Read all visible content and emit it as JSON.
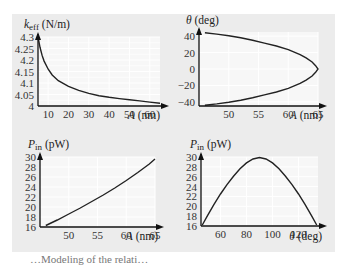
{
  "figure": {
    "panel_color": "#ececec",
    "caption_fragment": "…Modeling of the relati…"
  },
  "chart_data": [
    {
      "id": "keff-vs-A",
      "type": "line",
      "title": "",
      "ylabel": "k_eff (N/m)",
      "ylabel_main": "k",
      "ylabel_sub": "eff",
      "ylabel_unit": "(N/m)",
      "xlabel": "A (nm)",
      "xlabel_var": "A",
      "xlabel_unit": "(nm)",
      "xlim": [
        5,
        65
      ],
      "ylim": [
        4,
        4.3
      ],
      "xticks": [
        10,
        20,
        30,
        40,
        50,
        60
      ],
      "yticks": [
        "4",
        "4.05",
        "4.1",
        "4.15",
        "4.2",
        "4.25",
        "4.3"
      ],
      "grid": true,
      "x": [
        5,
        6,
        7,
        8,
        10,
        12,
        15,
        20,
        25,
        30,
        35,
        40,
        45,
        50,
        55,
        60,
        65
      ],
      "y": [
        4.3,
        4.255,
        4.22,
        4.195,
        4.16,
        4.135,
        4.11,
        4.085,
        4.068,
        4.055,
        4.045,
        4.038,
        4.032,
        4.027,
        4.022,
        4.017,
        4.012
      ]
    },
    {
      "id": "theta-vs-A",
      "type": "line",
      "title": "",
      "ylabel": "θ (deg)",
      "ylabel_main": "θ",
      "ylabel_unit": "(deg)",
      "xlabel": "A (nm)",
      "xlabel_var": "A",
      "xlabel_unit": "(nm)",
      "xlim": [
        45,
        65
      ],
      "ylim": [
        -45,
        45
      ],
      "xticks": [
        50,
        55,
        60,
        65
      ],
      "yticks": [
        "−40",
        "−20",
        "0",
        "20",
        "40"
      ],
      "ytick_values": [
        -40,
        -20,
        0,
        20,
        40
      ],
      "grid": true,
      "x": [
        46,
        48,
        50,
        52,
        54,
        56,
        58,
        60,
        62,
        63,
        64,
        64.6,
        65,
        64.6,
        64,
        63,
        62,
        60,
        58,
        56,
        54,
        52,
        50,
        48,
        46
      ],
      "y": [
        44,
        42.5,
        40.5,
        38,
        35,
        31.5,
        28,
        23.5,
        17.5,
        13.5,
        8.5,
        4,
        0,
        -4,
        -8.5,
        -13.5,
        -17.5,
        -23.5,
        -28,
        -31.5,
        -35,
        -38,
        -40.5,
        -42.5,
        -44
      ]
    },
    {
      "id": "Pin-vs-A",
      "type": "line",
      "title": "",
      "ylabel": "P_in (pW)",
      "ylabel_main": "P",
      "ylabel_sub": "in",
      "ylabel_unit": "(pW)",
      "xlabel": "A (nm)",
      "xlabel_var": "A",
      "xlabel_unit": "(nm)",
      "xlim": [
        45,
        65
      ],
      "ylim": [
        16,
        30
      ],
      "xticks": [
        50,
        55,
        60,
        65
      ],
      "yticks": [
        "16",
        "18",
        "20",
        "22",
        "24",
        "26",
        "28",
        "30"
      ],
      "grid": true,
      "x": [
        46,
        48,
        50,
        52,
        54,
        56,
        58,
        60,
        62,
        64,
        65
      ],
      "y": [
        16.3,
        17.4,
        18.6,
        19.8,
        21.1,
        22.4,
        23.8,
        25.3,
        26.9,
        28.6,
        29.6
      ]
    },
    {
      "id": "Pin-vs-theta",
      "type": "line",
      "title": "",
      "ylabel": "P_in (pW)",
      "ylabel_main": "P",
      "ylabel_sub": "in",
      "ylabel_unit": "(pW)",
      "xlabel": "θ (deg)",
      "xlabel_var": "θ",
      "xlabel_unit": "(deg)",
      "xlim": [
        45,
        135
      ],
      "ylim": [
        16,
        30
      ],
      "xticks": [
        60,
        80,
        100,
        120
      ],
      "yticks": [
        "16",
        "18",
        "20",
        "22",
        "24",
        "26",
        "28",
        "30"
      ],
      "grid": true,
      "x": [
        46,
        50,
        55,
        60,
        65,
        70,
        75,
        80,
        85,
        90,
        95,
        100,
        105,
        110,
        115,
        120,
        125,
        130,
        134
      ],
      "y": [
        16.2,
        18.1,
        20.4,
        22.5,
        24.4,
        26.1,
        27.6,
        28.8,
        29.6,
        29.9,
        29.6,
        28.8,
        27.6,
        26.1,
        24.4,
        22.5,
        20.4,
        18.1,
        16.2
      ]
    }
  ]
}
